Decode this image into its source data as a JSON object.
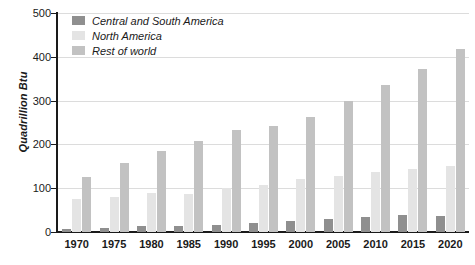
{
  "chart_data": {
    "type": "bar",
    "title": "",
    "subtitle": "",
    "xlabel": "",
    "ylabel": "Quadrillion Btu",
    "ylim": [
      0,
      500
    ],
    "yticks": [
      0,
      100,
      200,
      300,
      400,
      500
    ],
    "ytick_labels": [
      "0",
      "100",
      "200",
      "300",
      "400",
      "500"
    ],
    "grid": true,
    "grid_axis": "y",
    "legend_position": "top-left",
    "categories": [
      "1970",
      "1975",
      "1980",
      "1985",
      "1990",
      "1995",
      "2000",
      "2005",
      "2010",
      "2015",
      "2020"
    ],
    "series": [
      {
        "name": "Central and South America",
        "color": "#8f8f8f",
        "values": [
          8,
          9,
          13,
          14,
          17,
          21,
          26,
          30,
          35,
          38,
          37
        ]
      },
      {
        "name": "North America",
        "color": "#e4e4e4",
        "values": [
          76,
          81,
          88,
          87,
          101,
          108,
          121,
          129,
          137,
          143,
          150
        ]
      },
      {
        "name": "Rest of world",
        "color": "#c2c2c2",
        "values": [
          126,
          157,
          184,
          207,
          234,
          242,
          263,
          299,
          336,
          373,
          418
        ]
      }
    ]
  },
  "axes": {
    "y_title": "Quadrillion Btu"
  },
  "colors": {
    "series_0": "#8f8f8f",
    "series_1": "#e4e4e4",
    "series_2": "#c2c2c2",
    "axis": "#1a1a1a",
    "gridline": "#dcdcdc",
    "background": "#ffffff"
  }
}
